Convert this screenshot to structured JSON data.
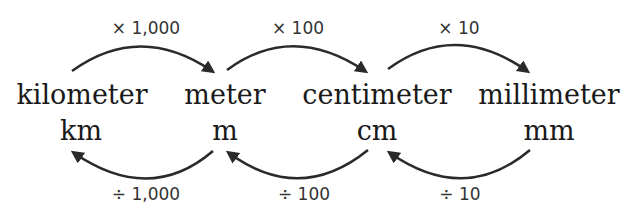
{
  "units": [
    {
      "name": "kilometer",
      "abbr": "km"
    },
    {
      "name": "meter",
      "abbr": "m"
    },
    {
      "name": "centimeter",
      "abbr": "cm"
    },
    {
      "name": "millimeter",
      "abbr": "mm"
    }
  ],
  "multiply": [
    {
      "from": "kilometer",
      "to": "meter",
      "label": "× 1,000"
    },
    {
      "from": "meter",
      "to": "centimeter",
      "label": "× 100"
    },
    {
      "from": "centimeter",
      "to": "millimeter",
      "label": "× 10"
    }
  ],
  "divide": [
    {
      "from": "meter",
      "to": "kilometer",
      "label": "÷ 1,000"
    },
    {
      "from": "centimeter",
      "to": "meter",
      "label": "÷ 100"
    },
    {
      "from": "millimeter",
      "to": "centimeter",
      "label": "÷ 10"
    }
  ],
  "colors": {
    "text": "#1a1a1a",
    "arrow": "#2a2a2a",
    "background": "#ffffff"
  }
}
